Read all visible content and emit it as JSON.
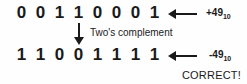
{
  "diagram": {
    "background_color": "#fefefe",
    "ink_color": "#1a1a1a",
    "top_row": {
      "bits": [
        "0",
        "0",
        "1",
        "1",
        "0",
        "0",
        "0",
        "1"
      ],
      "arrow_icon": "left-arrow-icon",
      "value": "+49",
      "base_subscript": "10"
    },
    "operation": {
      "arrow_icon": "down-arrow-icon",
      "caption": "Two's complement"
    },
    "bottom_row": {
      "bits": [
        "1",
        "1",
        "0",
        "0",
        "1",
        "1",
        "1",
        "1"
      ],
      "arrow_icon": "left-arrow-icon",
      "value": "-49",
      "base_subscript": "10"
    },
    "verdict": "CORRECT!"
  }
}
